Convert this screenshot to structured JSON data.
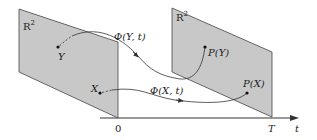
{
  "diagram": {
    "planes": [
      {
        "id": "left",
        "label": "R",
        "sup": "2"
      },
      {
        "id": "right",
        "label": "R",
        "sup": "2"
      }
    ],
    "points": {
      "Y": "Y",
      "X": "X",
      "PY": "P(Y)",
      "PX": "P(X)"
    },
    "flows": {
      "phiY": "Φ(Y, t)",
      "phiX": "Φ(X, t)"
    },
    "axis": {
      "start": "0",
      "end": "T",
      "var": "t"
    },
    "colors": {
      "plane_fill": "#c8c8c8",
      "stroke": "#333333"
    }
  }
}
